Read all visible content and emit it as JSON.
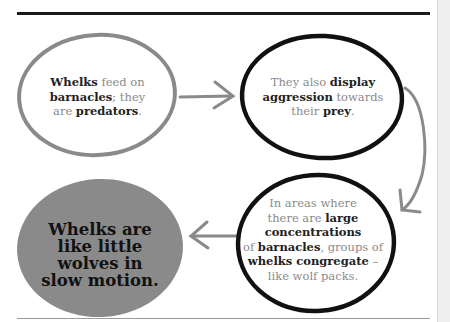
{
  "colors": {
    "gray_outline": "#8a8a8a",
    "black_outline": "#111111",
    "gray_fill": "#8a8a8a",
    "arrow": "#8a8a8a",
    "muted_text": "#8a8a8a",
    "bold_text": "#222222"
  },
  "nodes": [
    {
      "id": "feed",
      "style": "gray-outline",
      "parts": [
        {
          "t": "Whelks",
          "b": true
        },
        {
          "t": " feed on ",
          "b": false
        },
        {
          "t": "barnacles",
          "b": true
        },
        {
          "t": "; they are ",
          "b": false
        },
        {
          "t": "predators",
          "b": true
        },
        {
          "t": ".",
          "b": false
        }
      ]
    },
    {
      "id": "aggression",
      "style": "black-outline",
      "parts": [
        {
          "t": "They also ",
          "b": false
        },
        {
          "t": "display aggression",
          "b": true
        },
        {
          "t": " towards their ",
          "b": false
        },
        {
          "t": "prey",
          "b": true
        },
        {
          "t": ".",
          "b": false
        }
      ]
    },
    {
      "id": "congregate",
      "style": "black-outline",
      "parts": [
        {
          "t": "In areas where there are ",
          "b": false
        },
        {
          "t": "large concentrations",
          "b": true
        },
        {
          "t": " of ",
          "b": false
        },
        {
          "t": "barnacles",
          "b": true
        },
        {
          "t": ", groups of ",
          "b": false
        },
        {
          "t": "whelks congregate",
          "b": true
        },
        {
          "t": " – like wolf packs.",
          "b": false
        }
      ]
    },
    {
      "id": "conclusion",
      "style": "gray-fill",
      "text": "Whelks are like little wolves in slow motion."
    }
  ],
  "arrows": [
    {
      "from": "feed",
      "to": "aggression",
      "direction": "right"
    },
    {
      "from": "aggression",
      "to": "congregate",
      "direction": "down"
    },
    {
      "from": "congregate",
      "to": "conclusion",
      "direction": "left"
    }
  ],
  "lines": {
    "n1": [
      "Whelks|b",
      " feed on"
    ],
    "n1b": [
      "barnacles|b",
      "; they"
    ],
    "n1c": [
      "are ",
      "predators|b",
      "."
    ]
  }
}
